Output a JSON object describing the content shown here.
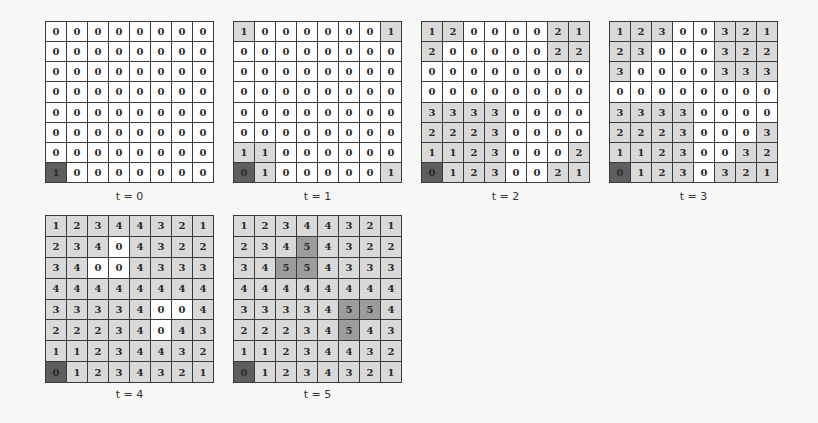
{
  "figure": {
    "panels": [
      {
        "label": "t = 0",
        "grid": [
          [
            0,
            0,
            0,
            0,
            0,
            0,
            0,
            0
          ],
          [
            0,
            0,
            0,
            0,
            0,
            0,
            0,
            0
          ],
          [
            0,
            0,
            0,
            0,
            0,
            0,
            0,
            0
          ],
          [
            0,
            0,
            0,
            0,
            0,
            0,
            0,
            0
          ],
          [
            0,
            0,
            0,
            0,
            0,
            0,
            0,
            0
          ],
          [
            0,
            0,
            0,
            0,
            0,
            0,
            0,
            0
          ],
          [
            0,
            0,
            0,
            0,
            0,
            0,
            0,
            0
          ],
          [
            1,
            0,
            0,
            0,
            0,
            0,
            0,
            0
          ]
        ]
      },
      {
        "label": "t = 1",
        "grid": [
          [
            1,
            0,
            0,
            0,
            0,
            0,
            0,
            1
          ],
          [
            0,
            0,
            0,
            0,
            0,
            0,
            0,
            0
          ],
          [
            0,
            0,
            0,
            0,
            0,
            0,
            0,
            0
          ],
          [
            0,
            0,
            0,
            0,
            0,
            0,
            0,
            0
          ],
          [
            0,
            0,
            0,
            0,
            0,
            0,
            0,
            0
          ],
          [
            0,
            0,
            0,
            0,
            0,
            0,
            0,
            0
          ],
          [
            1,
            1,
            0,
            0,
            0,
            0,
            0,
            0
          ],
          [
            0,
            1,
            0,
            0,
            0,
            0,
            0,
            1
          ]
        ]
      },
      {
        "label": "t = 2",
        "grid": [
          [
            1,
            2,
            0,
            0,
            0,
            0,
            2,
            1
          ],
          [
            2,
            0,
            0,
            0,
            0,
            0,
            2,
            2
          ],
          [
            0,
            0,
            0,
            0,
            0,
            0,
            0,
            0
          ],
          [
            0,
            0,
            0,
            0,
            0,
            0,
            0,
            0
          ],
          [
            3,
            3,
            3,
            3,
            0,
            0,
            0,
            0
          ],
          [
            2,
            2,
            2,
            3,
            0,
            0,
            0,
            0
          ],
          [
            1,
            1,
            2,
            3,
            0,
            0,
            0,
            2
          ],
          [
            0,
            1,
            2,
            3,
            0,
            0,
            2,
            1
          ]
        ]
      },
      {
        "label": "t = 3",
        "grid": [
          [
            1,
            2,
            3,
            0,
            0,
            3,
            2,
            1
          ],
          [
            2,
            3,
            0,
            0,
            0,
            3,
            2,
            2
          ],
          [
            3,
            0,
            0,
            0,
            0,
            3,
            3,
            3
          ],
          [
            0,
            0,
            0,
            0,
            0,
            0,
            0,
            0
          ],
          [
            3,
            3,
            3,
            3,
            0,
            0,
            0,
            0
          ],
          [
            2,
            2,
            2,
            3,
            0,
            0,
            0,
            3
          ],
          [
            1,
            1,
            2,
            3,
            0,
            0,
            3,
            2
          ],
          [
            0,
            1,
            2,
            3,
            0,
            3,
            2,
            1
          ]
        ]
      },
      {
        "label": "t = 4",
        "grid": [
          [
            1,
            2,
            3,
            4,
            4,
            3,
            2,
            1
          ],
          [
            2,
            3,
            4,
            0,
            4,
            3,
            2,
            2
          ],
          [
            3,
            4,
            0,
            0,
            4,
            3,
            3,
            3
          ],
          [
            4,
            4,
            4,
            4,
            4,
            4,
            4,
            4
          ],
          [
            3,
            3,
            3,
            3,
            4,
            0,
            0,
            4
          ],
          [
            2,
            2,
            2,
            3,
            4,
            0,
            4,
            3
          ],
          [
            1,
            1,
            2,
            3,
            4,
            4,
            3,
            2
          ],
          [
            0,
            1,
            2,
            3,
            4,
            3,
            2,
            1
          ]
        ]
      },
      {
        "label": "t = 5",
        "grid": [
          [
            1,
            2,
            3,
            4,
            4,
            3,
            2,
            1
          ],
          [
            2,
            3,
            4,
            5,
            4,
            3,
            2,
            2
          ],
          [
            3,
            4,
            5,
            5,
            4,
            3,
            3,
            3
          ],
          [
            4,
            4,
            4,
            4,
            4,
            4,
            4,
            4
          ],
          [
            3,
            3,
            3,
            3,
            4,
            5,
            5,
            4
          ],
          [
            2,
            2,
            2,
            3,
            4,
            5,
            4,
            3
          ],
          [
            1,
            1,
            2,
            3,
            4,
            4,
            3,
            2
          ],
          [
            0,
            1,
            2,
            3,
            4,
            3,
            2,
            1
          ]
        ]
      }
    ],
    "source_cell": {
      "row": 7,
      "col": 0
    },
    "colors": {
      "zero": "#fdfdfd",
      "reached": "#d9d9d9",
      "frontier": "#9c9c9c",
      "source": "#5e5e5e",
      "gridline": "#3a3a3a"
    }
  }
}
